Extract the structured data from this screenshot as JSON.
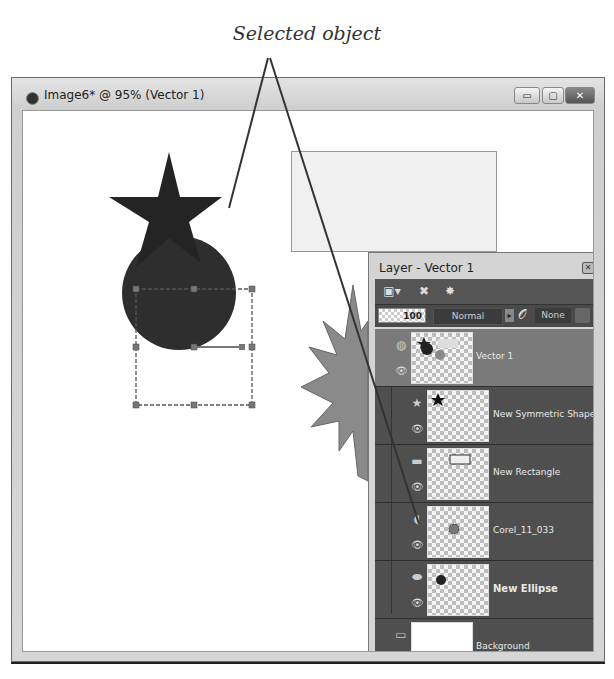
{
  "callout": {
    "label": "Selected object"
  },
  "window": {
    "title": "Image6* @ 95% (Vector 1)",
    "controls": {
      "minimize": "▭",
      "maximize": "▢",
      "close": "✕"
    }
  },
  "canvas": {
    "objects": [
      "star",
      "circle",
      "rectangle",
      "starburst"
    ],
    "selection": "circle"
  },
  "layers_panel": {
    "title": "Layer - Vector 1",
    "toolbar": {
      "new_layer": "▣▾",
      "delete_layer": "✖",
      "properties": "✸"
    },
    "opacity": "100",
    "blend_mode": "Normal",
    "blend_arrow": "▸",
    "link_icon": "𝒪",
    "mask_label": "None",
    "layers": [
      {
        "name": "Vector 1",
        "type_icon": "◍",
        "selected": true,
        "bold": false
      },
      {
        "name": "New Symmetric Shape",
        "type_icon": "★",
        "selected": false,
        "bold": false
      },
      {
        "name": "New Rectangle",
        "type_icon": "▬",
        "selected": false,
        "bold": false
      },
      {
        "name": "Corel_11_033",
        "type_icon": "◖",
        "selected": false,
        "bold": false
      },
      {
        "name": "New Ellipse",
        "type_icon": "⬬",
        "selected": false,
        "bold": true
      },
      {
        "name": "Background",
        "type_icon": "▭",
        "selected": false,
        "bold": false
      }
    ],
    "eye": "👁"
  },
  "colors": {
    "panel_bg": "#4f4f4f",
    "selected_row": "#7a7a7a",
    "shape_dark": "#2a2a2a",
    "starburst": "#8a8a8a"
  }
}
